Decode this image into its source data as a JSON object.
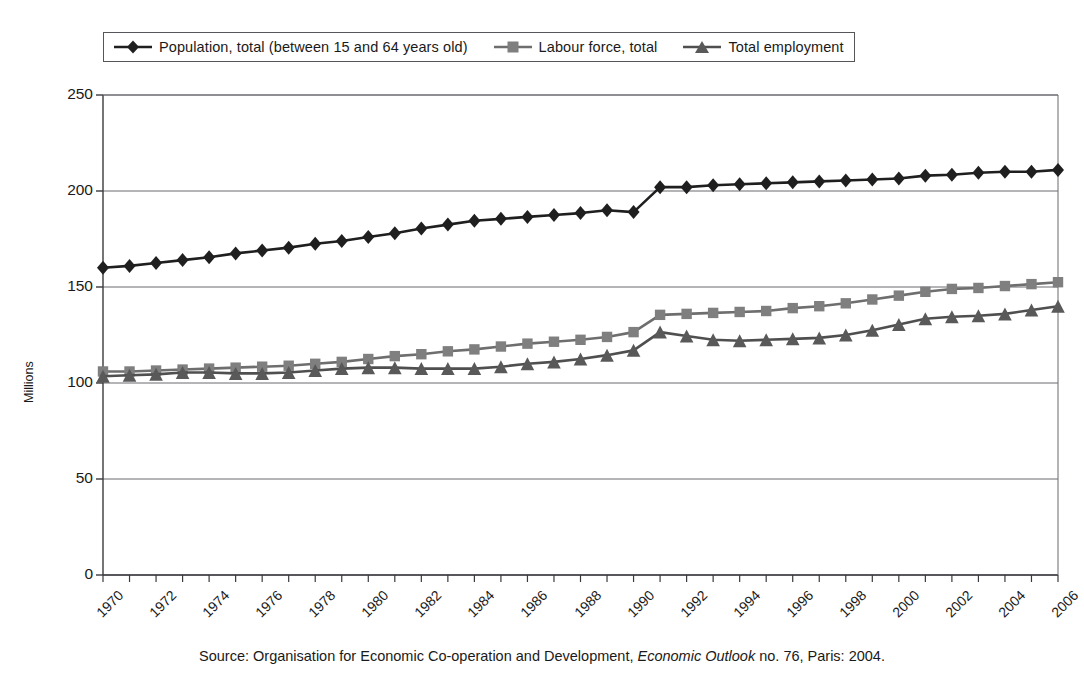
{
  "legend": {
    "position": "top-left-inside",
    "entries": [
      {
        "label": "Population, total (between 15 and 64 years old)",
        "marker": "diamond-marker",
        "color": "#1f1f1f"
      },
      {
        "label": "Labour force, total",
        "marker": "square-marker",
        "color": "#7f7f7f"
      },
      {
        "label": "Total employment",
        "marker": "triangle-marker",
        "color": "#595959"
      }
    ]
  },
  "axes": {
    "ylabel": "Millions",
    "yticks": [
      "0",
      "50",
      "100",
      "150",
      "200",
      "250"
    ],
    "xticks": [
      "1970",
      "1972",
      "1974",
      "1976",
      "1978",
      "1980",
      "1982",
      "1984",
      "1986",
      "1988",
      "1990",
      "1992",
      "1994",
      "1996",
      "1998",
      "2000",
      "2002",
      "2004",
      "2006"
    ]
  },
  "source": {
    "prefix": "Source: Organisation for Economic Co-operation and Development,",
    "italic": "Economic Outlook",
    "suffix": "no. 76, Paris: 2004."
  },
  "chart_data": {
    "type": "line",
    "title": "",
    "xlabel": "",
    "ylabel": "Millions",
    "xlim": [
      1970,
      2006
    ],
    "ylim": [
      0,
      250
    ],
    "grid": true,
    "legend_position": "top-left",
    "x": [
      1970,
      1971,
      1972,
      1973,
      1974,
      1975,
      1976,
      1977,
      1978,
      1979,
      1980,
      1981,
      1982,
      1983,
      1984,
      1985,
      1986,
      1987,
      1988,
      1989,
      1990,
      1991,
      1992,
      1993,
      1994,
      1995,
      1996,
      1997,
      1998,
      1999,
      2000,
      2001,
      2002,
      2003,
      2004,
      2005,
      2006
    ],
    "series": [
      {
        "name": "Population, total (between 15 and 64 years old)",
        "marker": "diamond",
        "color": "#1f1f1f",
        "values": [
          160.0,
          161.0,
          162.5,
          164.0,
          165.5,
          167.5,
          169.0,
          170.5,
          172.5,
          174.0,
          176.0,
          178.0,
          180.5,
          182.5,
          184.5,
          185.5,
          186.5,
          187.5,
          188.5,
          190.0,
          189.0,
          202.0,
          202.0,
          203.0,
          203.5,
          204.0,
          204.5,
          205.0,
          205.5,
          206.0,
          206.5,
          208.0,
          208.5,
          209.5,
          210.0,
          210.0,
          211.0
        ]
      },
      {
        "name": "Labour force, total",
        "marker": "square",
        "color": "#7f7f7f",
        "values": [
          106.0,
          106.0,
          106.5,
          107.0,
          107.5,
          108.0,
          108.5,
          109.0,
          110.0,
          111.0,
          112.5,
          114.0,
          115.0,
          116.5,
          117.5,
          119.0,
          120.5,
          121.5,
          122.5,
          124.0,
          126.5,
          135.5,
          136.0,
          136.5,
          137.0,
          137.5,
          139.0,
          140.0,
          141.5,
          143.5,
          145.5,
          147.5,
          149.0,
          149.5,
          150.5,
          151.5,
          152.5
        ]
      },
      {
        "name": "Total employment",
        "marker": "triangle",
        "color": "#595959"
      }
    ],
    "series_employment_values": [
      103.5,
      104.0,
      104.5,
      105.5,
      105.5,
      105.0,
      105.0,
      105.5,
      106.5,
      107.5,
      108.0,
      108.0,
      107.5,
      107.5,
      107.5,
      108.5,
      110.0,
      111.0,
      112.5,
      114.5,
      117.0,
      126.5,
      124.5,
      122.5,
      122.0,
      122.5,
      123.0,
      123.5,
      125.0,
      127.5,
      130.5,
      133.5,
      134.5,
      135.0,
      136.0,
      138.0,
      140.0
    ]
  }
}
